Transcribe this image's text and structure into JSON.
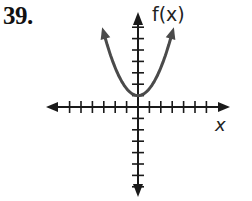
{
  "problem": {
    "number": "39."
  },
  "axes": {
    "y_label": "f(x)",
    "x_label": "x"
  },
  "colors": {
    "axis": "#1a1a1a",
    "curve": "#4a4a4a"
  },
  "chart_data": {
    "type": "line",
    "title": "39.",
    "xlabel": "x",
    "ylabel": "f(x)",
    "xlim": [
      -6.5,
      6.5
    ],
    "ylim": [
      -7.5,
      8.5
    ],
    "grid": false,
    "ticks": {
      "x": [
        -6,
        -5,
        -4,
        -3,
        -2,
        -1,
        1,
        2,
        3,
        4,
        5,
        6
      ],
      "y": [
        -7,
        -6,
        -5,
        -4,
        -3,
        -2,
        -1,
        1,
        2,
        3,
        4,
        5,
        6,
        7
      ],
      "labeled": false
    },
    "series": [
      {
        "name": "f(x)",
        "description": "upward-opening parabola with vertex at (0, 1), arrows on both ends",
        "vertex": [
          0,
          1
        ],
        "x": [
          -3,
          -2.5,
          -2,
          -1.5,
          -1,
          -0.5,
          0,
          0.5,
          1,
          1.5,
          2,
          2.5,
          3
        ],
        "y": [
          6.5,
          4.8,
          3.4,
          2.35,
          1.6,
          1.15,
          1,
          1.15,
          1.6,
          2.35,
          3.4,
          4.8,
          6.5
        ]
      }
    ]
  }
}
